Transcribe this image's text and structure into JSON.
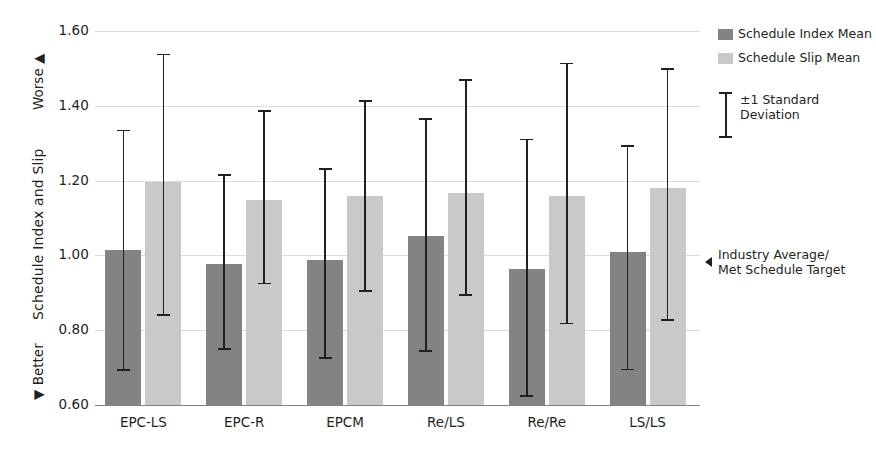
{
  "chart_data": {
    "type": "bar",
    "title": "",
    "xlabel": "",
    "ylabel": "Schedule Index and Slip",
    "ylim": [
      0.6,
      1.6
    ],
    "yticks": [
      "0.60",
      "0.80",
      "1.00",
      "1.20",
      "1.40",
      "1.60"
    ],
    "grid": true,
    "legend_position": "right",
    "categories": [
      "EPC-LS",
      "EPC-R",
      "EPCM",
      "Re/LS",
      "Re/Re",
      "LS/LS"
    ],
    "series": [
      {
        "name": "Schedule Index Mean",
        "color": "#838383",
        "values": [
          1.015,
          0.977,
          0.987,
          1.053,
          0.965,
          1.008
        ],
        "err_upper": [
          1.334,
          1.215,
          1.231,
          1.365,
          1.31,
          1.292
        ],
        "err_lower": [
          0.693,
          0.749,
          0.726,
          0.744,
          0.624,
          0.695
        ]
      },
      {
        "name": "Schedule Slip Mean",
        "color": "#c9c9c9",
        "values": [
          1.196,
          1.148,
          1.158,
          1.167,
          1.158,
          1.181
        ],
        "err_upper": [
          1.537,
          1.387,
          1.412,
          1.47,
          1.513,
          1.498
        ],
        "err_lower": [
          0.84,
          0.925,
          0.905,
          0.895,
          0.818,
          0.827
        ]
      }
    ],
    "annotations": {
      "worse": "Worse",
      "better": "Better",
      "worse_arrow": "▲",
      "better_arrow": "▼",
      "industry_average": "Industry Average/",
      "industry_average_line2": "Met Schedule Target",
      "industry_average_value": 1.0
    }
  },
  "legend": {
    "items": [
      {
        "label": "Schedule Index Mean",
        "swatch": "dark"
      },
      {
        "label": "Schedule Slip Mean",
        "swatch": "light"
      }
    ],
    "error_label_line1": "±1 Standard",
    "error_label_line2": "Deviation"
  }
}
